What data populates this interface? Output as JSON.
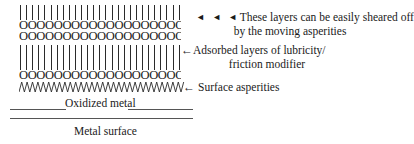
{
  "figure": {
    "type": "schematic-diagram",
    "background_color": "#ffffff",
    "ink_color": "#1a1a1a",
    "rule_color": "#555555"
  },
  "layers": [
    {
      "id": "tick-row-top",
      "glyph": "vertical-stroke",
      "count": 27,
      "role": "upper lubricity molecule tails"
    },
    {
      "id": "circle-row-1",
      "glyph": "O",
      "text": "OOOOOOOOOOOOOOOOOOOOOOOOOOO",
      "role": "upper polar head groups"
    },
    {
      "id": "circle-row-2",
      "glyph": "O",
      "text": "OOOOOOOOOOOOOOOOOOOOOOOOOOO",
      "role": "second polar head group row"
    },
    {
      "id": "tick-row-bottom",
      "glyph": "vertical-stroke",
      "count": 27,
      "role": "lower lubricity molecule tails"
    },
    {
      "id": "circle-row-3",
      "glyph": "O",
      "text": "OOOOOOOOOOOOOOOOOOOOOOOOOOO",
      "role": "adsorbed polar head groups on metal"
    },
    {
      "id": "asperity-row",
      "glyph": "zigzag",
      "peaks": 30,
      "role": "surface asperities"
    }
  ],
  "substrate": {
    "oxide_label": "Oxidized metal",
    "metal_label": "Metal surface"
  },
  "annotations": {
    "shear": {
      "arrows": "◄ ◄ ◄",
      "line1": "These layers can be easily sheared off",
      "line2": "by the moving asperities"
    },
    "adsorbed": {
      "arrow": "←",
      "line1": "Adsorbed layers of lubricity/",
      "line2": "friction modifier"
    },
    "asperities": {
      "arrow": "←",
      "label": "Surface asperities"
    }
  }
}
